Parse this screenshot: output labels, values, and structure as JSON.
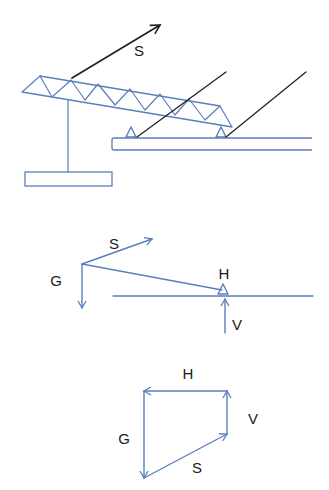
{
  "colors": {
    "structure": "#5b7fbd",
    "force_black": "#222222",
    "label": "#1a1a1a",
    "background": "#ffffff"
  },
  "diagram_1": {
    "name": "crane-truss-structure",
    "truss": {
      "top_chord": [
        [
          40,
          76
        ],
        [
          220,
          106
        ]
      ],
      "bottom_chord": [
        [
          22,
          92
        ],
        [
          232,
          127
        ]
      ],
      "web_nodes": [
        [
          22,
          92
        ],
        [
          40,
          76
        ],
        [
          52,
          97
        ],
        [
          71,
          80
        ],
        [
          85,
          100
        ],
        [
          98,
          84
        ],
        [
          115,
          105
        ],
        [
          130,
          89
        ],
        [
          145,
          110
        ],
        [
          160,
          94
        ],
        [
          175,
          115
        ],
        [
          189,
          99
        ],
        [
          205,
          120
        ],
        [
          220,
          106
        ],
        [
          232,
          127
        ]
      ]
    },
    "post": [
      [
        68,
        100
      ],
      [
        68,
        172
      ]
    ],
    "counterweight_box": {
      "x": 25,
      "y": 172,
      "w": 87,
      "h": 14
    },
    "base_plate": {
      "x": 112,
      "y": 138,
      "w": 200,
      "h": 12
    },
    "supports": [
      {
        "cx": 131,
        "base_y": 137
      },
      {
        "cx": 221,
        "base_y": 137
      }
    ],
    "rods": [
      [
        [
          137,
          137
        ],
        [
          226,
          72
        ]
      ],
      [
        [
          226,
          137
        ],
        [
          306,
          72
        ]
      ]
    ],
    "force_S": {
      "from": [
        72,
        78
      ],
      "to": [
        160,
        25
      ],
      "label": "S",
      "label_pos": [
        139,
        50
      ]
    }
  },
  "diagram_2": {
    "name": "free-body-diagram",
    "origin": [
      82,
      264
    ],
    "force_S": {
      "to": [
        152,
        239
      ],
      "label": "S",
      "label_pos": [
        114,
        243
      ]
    },
    "force_G": {
      "to": [
        82,
        308
      ],
      "label": "G",
      "label_pos": [
        56,
        280
      ]
    },
    "boom_line": [
      [
        82,
        264
      ],
      [
        222,
        290
      ]
    ],
    "ground_line": [
      [
        113,
        296
      ],
      [
        313,
        296
      ]
    ],
    "support": {
      "cx": 223,
      "base_y": 294,
      "label": "H",
      "label_pos": [
        224,
        273
      ]
    },
    "force_V": {
      "from": [
        225,
        333
      ],
      "to": [
        225,
        299
      ],
      "label": "V",
      "label_pos": [
        237,
        324
      ]
    }
  },
  "diagram_3": {
    "name": "force-polygon",
    "vertices": {
      "top_left": [
        144,
        391
      ],
      "top_right": [
        227,
        391
      ],
      "bottom_right": [
        227,
        434
      ],
      "bottom_left": [
        144,
        478
      ]
    },
    "force_H": {
      "label": "H",
      "label_pos": [
        188,
        373
      ]
    },
    "force_V": {
      "label": "V",
      "label_pos": [
        253,
        418
      ]
    },
    "force_G": {
      "label": "G",
      "label_pos": [
        124,
        438
      ]
    },
    "force_S": {
      "label": "S",
      "label_pos": [
        197,
        467
      ]
    }
  }
}
